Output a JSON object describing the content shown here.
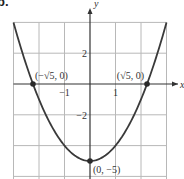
{
  "problem_label": "b.",
  "chart_data": {
    "type": "line",
    "title": "",
    "function": "y = x^2 - 5",
    "xlabel": "x",
    "ylabel": "y",
    "xlim": [
      -3,
      3
    ],
    "ylim": [
      -6,
      4
    ],
    "grid": true,
    "x_grid_step": 1,
    "y_grid_step": 2,
    "x_tick_labels": [
      {
        "value": -1,
        "label": "−1"
      },
      {
        "value": 1,
        "label": "1"
      }
    ],
    "y_tick_labels": [
      {
        "value": 2,
        "label": "2"
      },
      {
        "value": -2,
        "label": "−2"
      }
    ],
    "series": [
      {
        "name": "parabola",
        "x": [
          -3,
          -2.5,
          -2,
          -1.5,
          -1,
          -0.5,
          0,
          0.5,
          1,
          1.5,
          2,
          2.5,
          3
        ],
        "y": [
          4,
          1.25,
          -1,
          -2.75,
          -4,
          -4.75,
          -5,
          -4.75,
          -4,
          -2.75,
          -1,
          1.25,
          4
        ]
      }
    ],
    "points": [
      {
        "x": -2.236,
        "y": 0,
        "label": "(−√5, 0)"
      },
      {
        "x": 2.236,
        "y": 0,
        "label": "(√5, 0)"
      },
      {
        "x": 0,
        "y": -5,
        "label": "(0, −5)"
      }
    ],
    "colors": {
      "curve": "#3a3a3a",
      "grid": "#b8b8b8",
      "axis": "#333333",
      "point": "#2a2a2a"
    }
  }
}
